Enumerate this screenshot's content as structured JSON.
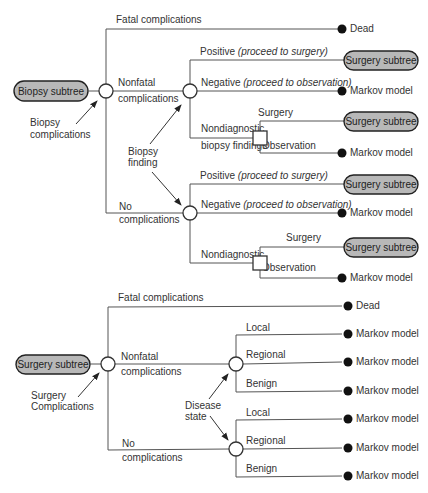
{
  "colors": {
    "line": "#555555",
    "pill_fill": "#b8b8b8",
    "terminal": "#111111",
    "text": "#333333"
  },
  "biopsy_tree": {
    "root": {
      "label": "Biopsy subtree",
      "x": 43,
      "y": 91
    },
    "root_node": {
      "x": 106,
      "y": 91,
      "type": "chance"
    },
    "root_annotation": {
      "lines": [
        "Biopsy",
        "complications"
      ],
      "x": 28,
      "y": 124
    },
    "branches": {
      "fatal": {
        "label": "Fatal complications",
        "terminal": "Dead"
      },
      "nonfatal": {
        "label_lines": [
          "Nonfatal",
          "complications"
        ]
      },
      "none": {
        "label_lines": [
          "No",
          "complications"
        ]
      }
    },
    "finding_annotation": {
      "lines": [
        "Biopsy",
        "finding"
      ]
    },
    "nonfatal_outcomes": [
      {
        "label": "Positive",
        "note": "(proceed to surgery)",
        "result": "Surgery subtree",
        "result_type": "pill"
      },
      {
        "label": "Negative",
        "note": "(proceed to observation)",
        "result": "Markov model",
        "result_type": "terminal"
      },
      {
        "label": "Nondiagnostic",
        "label2": "biopsy findings",
        "decision": [
          {
            "label": "Surgery",
            "result": "Surgery subtree",
            "result_type": "pill"
          },
          {
            "label": "Observation",
            "result": "Markov model",
            "result_type": "terminal"
          }
        ]
      }
    ],
    "nocomp_outcomes": [
      {
        "label": "Positive",
        "note": "(proceed to surgery)",
        "result": "Surgery subtree",
        "result_type": "pill"
      },
      {
        "label": "Negative",
        "note": "(proceed to observation)",
        "result": "Markov model",
        "result_type": "terminal"
      },
      {
        "label": "Nondiagnostic",
        "decision": [
          {
            "label": "Surgery",
            "result": "Surgery subtree",
            "result_type": "pill"
          },
          {
            "label": "Observation",
            "result": "Markov model",
            "result_type": "terminal"
          }
        ]
      }
    ]
  },
  "surgery_tree": {
    "root": {
      "label": "Surgery subtree"
    },
    "root_annotation": {
      "lines": [
        "Surgery",
        "Complications"
      ]
    },
    "branches": {
      "fatal": {
        "label": "Fatal complications",
        "terminal": "Dead"
      },
      "nonfatal": {
        "label_lines": [
          "Nonfatal",
          "complications"
        ]
      },
      "none": {
        "label_lines": [
          "No",
          "complications"
        ]
      }
    },
    "disease_annotation": {
      "lines": [
        "Disease",
        "state"
      ]
    },
    "nonfatal_outcomes": [
      {
        "label": "Local",
        "result": "Markov model"
      },
      {
        "label": "Regional",
        "result": "Markov model"
      },
      {
        "label": "Benign",
        "result": "Markov model"
      }
    ],
    "nocomp_outcomes": [
      {
        "label": "Local",
        "result": "Markov model"
      },
      {
        "label": "Regional",
        "result": "Markov model"
      },
      {
        "label": "Benign",
        "result": "Markov model"
      }
    ]
  }
}
